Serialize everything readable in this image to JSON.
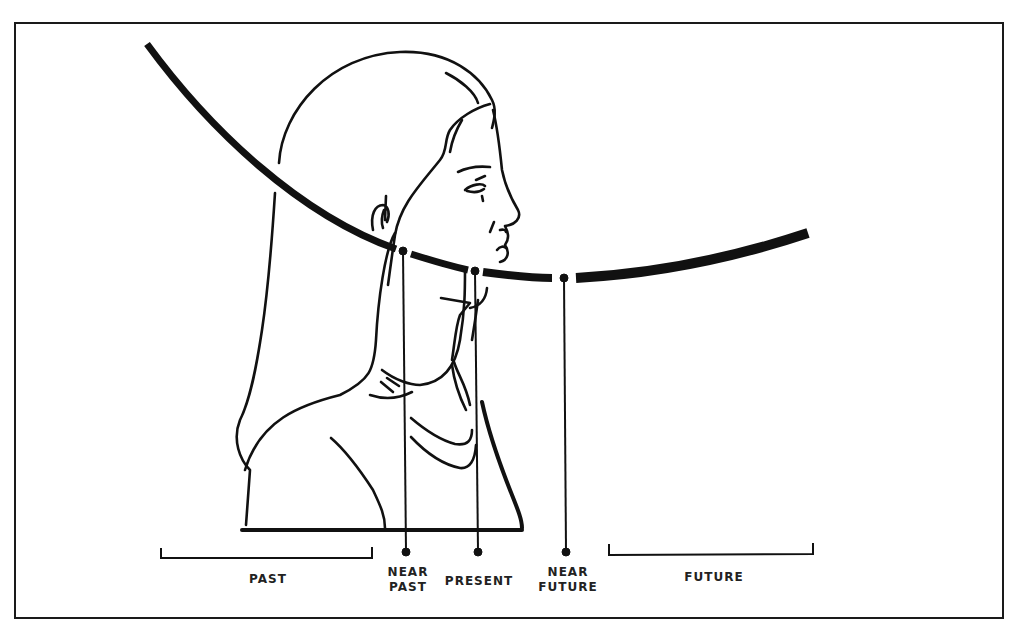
{
  "figure": {
    "stroke_color": "#111111",
    "background": "#ffffff",
    "points": [
      {
        "id": "near-past",
        "label": "NEAR\nPAST",
        "curve_x": 403,
        "curve_y": 251,
        "drop_y": 551
      },
      {
        "id": "present",
        "label": "PRESENT",
        "curve_x": 475,
        "curve_y": 271,
        "drop_y": 551
      },
      {
        "id": "near-future",
        "label": "NEAR\nFUTURE",
        "curve_x": 564,
        "curve_y": 278,
        "drop_y": 551
      }
    ],
    "ranges": [
      {
        "id": "past",
        "label": "PAST",
        "x1": 161,
        "x2": 372,
        "y": 557
      },
      {
        "id": "future",
        "label": "FUTURE",
        "x1": 609,
        "x2": 813,
        "y": 554
      }
    ]
  },
  "labels": {
    "past": "PAST",
    "near_past": "NEAR\nPAST",
    "present": "PRESENT",
    "near_future": "NEAR\nFUTURE",
    "future": "FUTURE"
  }
}
